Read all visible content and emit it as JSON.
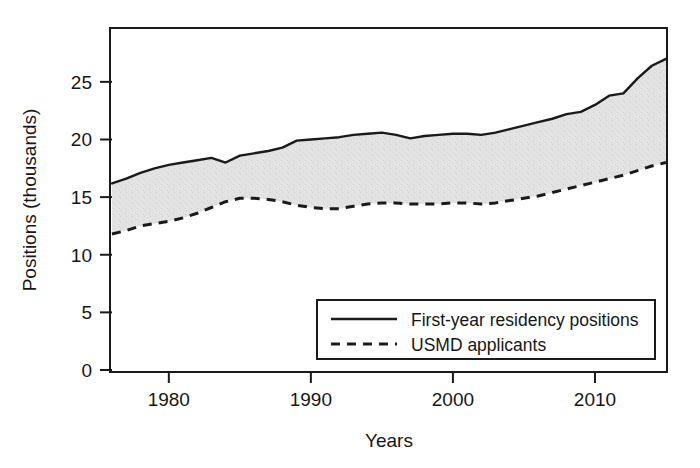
{
  "chart_data": {
    "type": "area",
    "title": "",
    "subtitle": "",
    "xlabel": "Years",
    "ylabel": "Positions (thousands)",
    "xlim": [
      1976,
      2015
    ],
    "ylim": [
      0,
      29.5
    ],
    "xticks": [
      1980,
      1990,
      2000,
      2010
    ],
    "xtick_labels": [
      "1980",
      "1990",
      "2000",
      "2010"
    ],
    "yticks": [
      0,
      5,
      10,
      15,
      20,
      25
    ],
    "ytick_labels": [
      "0",
      "5",
      "10",
      "15",
      "20",
      "25"
    ],
    "grid": false,
    "legend_position": "lower right",
    "fill_between": {
      "upper_series": "First-year residency positions",
      "lower_series": "USMD applicants",
      "color": "#e2e2e2"
    },
    "x": [
      1976,
      1977,
      1978,
      1979,
      1980,
      1981,
      1982,
      1983,
      1984,
      1985,
      1986,
      1987,
      1988,
      1989,
      1990,
      1991,
      1992,
      1993,
      1994,
      1995,
      1996,
      1997,
      1998,
      1999,
      2000,
      2001,
      2002,
      2003,
      2004,
      2005,
      2006,
      2007,
      2008,
      2009,
      2010,
      2011,
      2012,
      2013,
      2014,
      2015
    ],
    "series": [
      {
        "name": "First-year residency positions",
        "style": "solid",
        "color": "#1a1a1a",
        "values": [
          16.2,
          16.6,
          17.1,
          17.5,
          17.8,
          18.0,
          18.2,
          18.4,
          18.0,
          18.6,
          18.8,
          19.0,
          19.3,
          19.9,
          20.0,
          20.1,
          20.2,
          20.4,
          20.5,
          20.6,
          20.4,
          20.1,
          20.3,
          20.4,
          20.5,
          20.5,
          20.4,
          20.6,
          20.9,
          21.2,
          21.5,
          21.8,
          22.2,
          22.4,
          23.0,
          23.8,
          24.0,
          25.3,
          26.4,
          27.0
        ]
      },
      {
        "name": "USMD applicants",
        "style": "dashed",
        "color": "#1a1a1a",
        "values": [
          11.8,
          12.1,
          12.5,
          12.7,
          12.9,
          13.2,
          13.6,
          14.1,
          14.6,
          14.9,
          14.9,
          14.8,
          14.6,
          14.3,
          14.1,
          14.0,
          14.0,
          14.2,
          14.4,
          14.5,
          14.5,
          14.4,
          14.4,
          14.4,
          14.5,
          14.5,
          14.4,
          14.5,
          14.7,
          14.9,
          15.1,
          15.4,
          15.7,
          16.0,
          16.3,
          16.6,
          16.9,
          17.3,
          17.7,
          18.0
        ]
      }
    ],
    "legend": [
      {
        "label": "First-year residency positions",
        "style": "solid"
      },
      {
        "label": "USMD applicants",
        "style": "dashed"
      }
    ]
  }
}
